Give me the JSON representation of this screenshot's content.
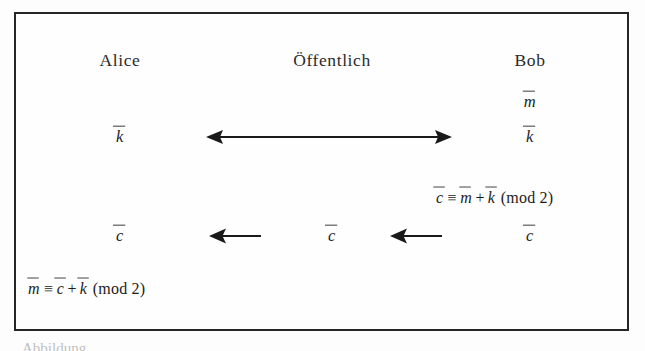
{
  "figure": {
    "type": "protocol-diagram",
    "topic": "One-Time-Pad / symmetric key exchange between Alice and Bob",
    "background_color": "#fdfdfd",
    "border_color": "#262626",
    "text_color": "#1c1c1c"
  },
  "columns": {
    "left_label": "Alice",
    "center_label": "Öffentlich",
    "right_label": "Bob"
  },
  "symbols": {
    "m": "m",
    "k": "k",
    "c": "c"
  },
  "rows": {
    "message_row": {
      "right_value": "m"
    },
    "key_row": {
      "left_value": "k",
      "right_value": "k",
      "channel_arrow": "double-headed-horizontal-arrow"
    },
    "encrypt_row": {
      "equation_lhs": "c",
      "equation_rel": "≡",
      "equation_term1": "m",
      "equation_op": "+",
      "equation_term2": "k",
      "equation_mod": "(mod 2)"
    },
    "cipher_row": {
      "left_value": "c",
      "center_value": "c",
      "right_value": "c",
      "arrow_1": "left-arrow",
      "arrow_2": "left-arrow"
    },
    "decrypt_row": {
      "equation_lhs": "m",
      "equation_rel": "≡",
      "equation_term1": "c",
      "equation_op": "+",
      "equation_term2": "k",
      "equation_mod": "(mod 2)"
    }
  },
  "caption": {
    "cutoff_text": "Abbildung"
  }
}
